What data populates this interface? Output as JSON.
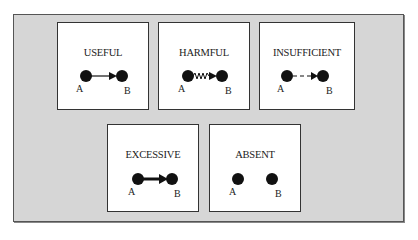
{
  "figure": {
    "panels": [
      {
        "id": "useful",
        "title": "USEFUL",
        "node_a": "A",
        "node_b": "B",
        "link_style": "solid-arrow"
      },
      {
        "id": "harmful",
        "title": "HARMFUL",
        "node_a": "A",
        "node_b": "B",
        "link_style": "wavy-arrow"
      },
      {
        "id": "insufficient",
        "title": "INSUFFICIENT",
        "node_a": "A",
        "node_b": "B",
        "link_style": "dashed-arrow"
      },
      {
        "id": "excessive",
        "title": "EXCESSIVE",
        "node_a": "A",
        "node_b": "B",
        "link_style": "thick-arrow"
      },
      {
        "id": "absent",
        "title": "ABSENT",
        "node_a": "A",
        "node_b": "B",
        "link_style": "none"
      }
    ]
  },
  "colors": {
    "background": "#d6d6d6",
    "panel": "#ffffff",
    "ink": "#111111"
  }
}
